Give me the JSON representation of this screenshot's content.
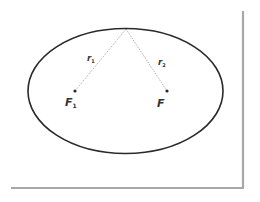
{
  "diagram": {
    "colors": {
      "background": "#ffffff",
      "ellipse_stroke": "#2a2a2a",
      "dotted_line": "#9a9a9a",
      "frame_shadow": "#a8a8a8",
      "text": "#333333"
    },
    "ellipse": {
      "cx": 125.5,
      "cy": 91,
      "rx": 97.5,
      "ry": 62.5
    },
    "apex": {
      "x": 126,
      "y": 29
    },
    "foci": [
      {
        "id": "F1",
        "x": 75,
        "y": 91,
        "label": "F",
        "subscript": "1"
      },
      {
        "id": "F2",
        "x": 167,
        "y": 91,
        "label": "F",
        "subscript": ""
      }
    ],
    "radii": [
      {
        "label": "r",
        "subscript": "1",
        "from": "apex",
        "to": "F1"
      },
      {
        "label": "r",
        "subscript": "2",
        "from": "apex",
        "to": "F2"
      }
    ]
  }
}
